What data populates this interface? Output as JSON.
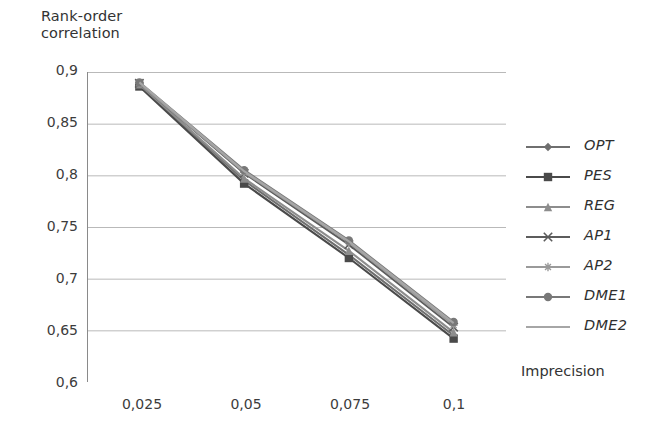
{
  "chart_data": {
    "type": "line",
    "title": "",
    "ylabel": "Rank-order correlation",
    "xlabel": "Imprecision",
    "x": [
      0.025,
      0.05,
      0.075,
      0.1
    ],
    "xtick_labels": [
      "0,025",
      "0,05",
      "0,075",
      "0,1"
    ],
    "ytick_labels": [
      "0,9",
      "0,85",
      "0,8",
      "0,75",
      "0,7",
      "0,65",
      "0,6"
    ],
    "ytick_values": [
      0.9,
      0.85,
      0.8,
      0.75,
      0.7,
      0.65,
      0.6
    ],
    "ylim": [
      0.6,
      0.9
    ],
    "xlim": [
      0.0125,
      0.1125
    ],
    "grid": "horizontal",
    "legend_position": "right",
    "series": [
      {
        "name": "OPT",
        "marker": "diamond",
        "color": "#6f6f6f",
        "values": [
          0.888,
          0.795,
          0.723,
          0.645
        ]
      },
      {
        "name": "PES",
        "marker": "square",
        "color": "#4a4a4a",
        "values": [
          0.886,
          0.792,
          0.72,
          0.642
        ]
      },
      {
        "name": "REG",
        "marker": "triangle",
        "color": "#8d8d8d",
        "values": [
          0.888,
          0.797,
          0.727,
          0.648
        ]
      },
      {
        "name": "AP1",
        "marker": "cross",
        "color": "#5c5c5c",
        "values": [
          0.889,
          0.802,
          0.733,
          0.653
        ]
      },
      {
        "name": "AP2",
        "marker": "star",
        "color": "#9a9a9a",
        "values": [
          0.889,
          0.803,
          0.735,
          0.655
        ]
      },
      {
        "name": "DME1",
        "marker": "circle",
        "color": "#787878",
        "values": [
          0.89,
          0.805,
          0.737,
          0.658
        ]
      },
      {
        "name": "DME2",
        "marker": "line",
        "color": "#a6a6a6",
        "values": [
          0.89,
          0.804,
          0.736,
          0.657
        ]
      }
    ]
  },
  "axis": {
    "y_title_line1": "Rank-order",
    "y_title_line2": "correlation",
    "x_title": "Imprecision"
  },
  "legend": {
    "items": [
      {
        "label": "OPT"
      },
      {
        "label": "PES"
      },
      {
        "label": "REG"
      },
      {
        "label": "AP1"
      },
      {
        "label": "AP2"
      },
      {
        "label": "DME1"
      },
      {
        "label": "DME2"
      }
    ]
  },
  "style": {
    "background": "#ffffff",
    "grid_color": "#b9b9b9",
    "axis_color": "#8a8a8a",
    "text_color": "#3c3c3c"
  }
}
